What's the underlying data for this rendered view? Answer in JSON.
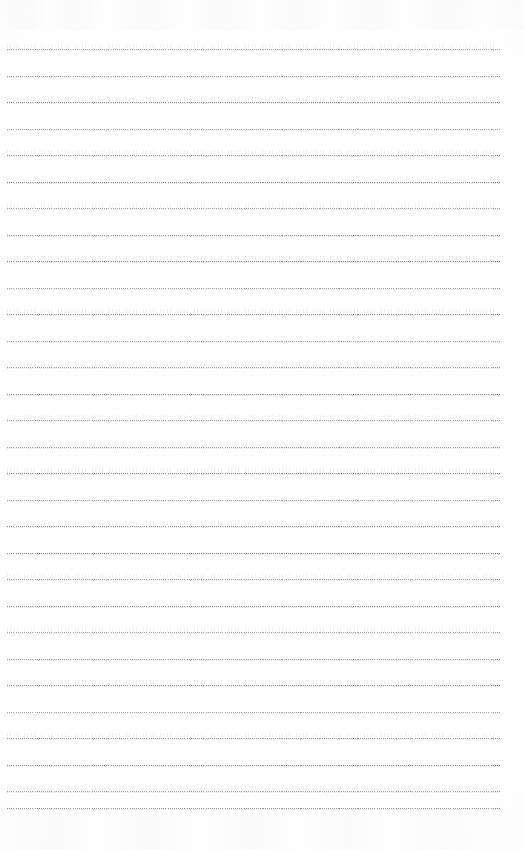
{
  "document": {
    "type": "scanned-lined-paper",
    "title": "",
    "visible_text": "",
    "body_text": "",
    "header_text": "",
    "footer_text": "",
    "page_number": "",
    "note": ""
  },
  "page": {
    "width": 524,
    "height": 850,
    "background_color": "#fefefe",
    "orientation": "portrait"
  },
  "ruling": {
    "style": "dotted",
    "line_color": "#8d8d93",
    "line_thickness_px": 1,
    "line_count": 30,
    "first_line_y": 49,
    "line_spacing_px": 26.5,
    "left_margin_x": 7,
    "right_margin_x": 500,
    "line_length_px": 493,
    "lines_y": [
      49,
      75.5,
      102,
      128.5,
      155,
      181.5,
      208,
      234.5,
      261,
      287.5,
      314,
      340.5,
      367,
      393.5,
      420,
      446.5,
      473,
      499.5,
      526,
      552.5,
      579,
      605.5,
      632,
      658.5,
      685,
      711.5,
      738,
      764.5,
      791,
      808
    ]
  },
  "artifacts": {
    "top_ghost_band_label": "faint scan ghosting",
    "bottom_ghost_band_label": "faint scan ghosting",
    "vignette_label": "paper edge shading"
  }
}
